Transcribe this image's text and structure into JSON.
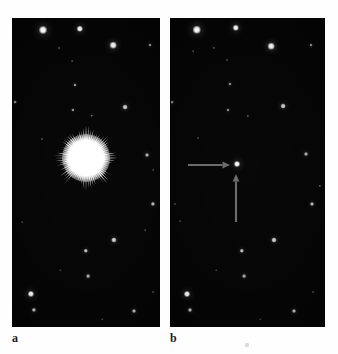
{
  "figure": {
    "kind": "astronomical-before-after-photograph",
    "background_color": "#fefefe",
    "sky_color": "#040404",
    "star_color": "#ffffff",
    "arrow_color": "#6a6a6a"
  },
  "panels": [
    {
      "id": "a",
      "caption": "a",
      "description": "Star field with bright saturated object showing radial diffraction spikes",
      "x": 12,
      "y": 18,
      "width": 148,
      "height": 309,
      "burst": {
        "cx": 74,
        "cy": 140,
        "core_radius": 17,
        "halo_radius": 24,
        "spike_max_radius": 36,
        "spike_count": 72
      },
      "stars": [
        {
          "x": 31,
          "y": 12,
          "r": 4.0,
          "b": 1.0
        },
        {
          "x": 68,
          "y": 11,
          "r": 3.2,
          "b": 0.97
        },
        {
          "x": 101,
          "y": 27,
          "r": 3.3,
          "b": 0.96
        },
        {
          "x": 138,
          "y": 27,
          "r": 1.5,
          "b": 0.55
        },
        {
          "x": 47,
          "y": 30,
          "r": 1.0,
          "b": 0.4
        },
        {
          "x": 60,
          "y": 43,
          "r": 0.9,
          "b": 0.33
        },
        {
          "x": 63,
          "y": 67,
          "r": 1.6,
          "b": 0.6
        },
        {
          "x": 3,
          "y": 84,
          "r": 1.4,
          "b": 0.52
        },
        {
          "x": 61,
          "y": 92,
          "r": 1.6,
          "b": 0.58
        },
        {
          "x": 113,
          "y": 89,
          "r": 2.4,
          "b": 0.82
        },
        {
          "x": 80,
          "y": 98,
          "r": 1.2,
          "b": 0.45
        },
        {
          "x": 30,
          "y": 121,
          "r": 1.0,
          "b": 0.38
        },
        {
          "x": 135,
          "y": 137,
          "r": 2.0,
          "b": 0.72
        },
        {
          "x": 141,
          "y": 152,
          "r": 0.9,
          "b": 0.3
        },
        {
          "x": 141,
          "y": 186,
          "r": 2.1,
          "b": 0.74
        },
        {
          "x": 133,
          "y": 212,
          "r": 0.9,
          "b": 0.3
        },
        {
          "x": 10,
          "y": 204,
          "r": 0.9,
          "b": 0.28
        },
        {
          "x": 102,
          "y": 222,
          "r": 2.6,
          "b": 0.86
        },
        {
          "x": 74,
          "y": 233,
          "r": 2.2,
          "b": 0.78
        },
        {
          "x": 76,
          "y": 258,
          "r": 1.9,
          "b": 0.68
        },
        {
          "x": 48,
          "y": 252,
          "r": 0.8,
          "b": 0.26
        },
        {
          "x": 19,
          "y": 276,
          "r": 3.1,
          "b": 0.95
        },
        {
          "x": 22,
          "y": 292,
          "r": 2.1,
          "b": 0.74
        },
        {
          "x": 122,
          "y": 293,
          "r": 2.0,
          "b": 0.7
        },
        {
          "x": 141,
          "y": 274,
          "r": 1.0,
          "b": 0.35
        },
        {
          "x": 90,
          "y": 301,
          "r": 0.8,
          "b": 0.26
        }
      ]
    },
    {
      "id": "b",
      "caption": "b",
      "description": "Same star field later; the object has faded to a faint point marked by two arrows",
      "x": 170,
      "y": 18,
      "width": 155,
      "height": 309,
      "stars": [
        {
          "x": 27,
          "y": 12,
          "r": 4.2,
          "b": 1.0
        },
        {
          "x": 66,
          "y": 10,
          "r": 3.2,
          "b": 0.97
        },
        {
          "x": 101,
          "y": 28,
          "r": 3.3,
          "b": 0.96
        },
        {
          "x": 141,
          "y": 27,
          "r": 1.5,
          "b": 0.52
        },
        {
          "x": 44,
          "y": 30,
          "r": 1.1,
          "b": 0.4
        },
        {
          "x": 57,
          "y": 42,
          "r": 1.0,
          "b": 0.35
        },
        {
          "x": 23,
          "y": 33,
          "r": 0.9,
          "b": 0.3
        },
        {
          "x": 60,
          "y": 66,
          "r": 1.6,
          "b": 0.58
        },
        {
          "x": 2,
          "y": 84,
          "r": 1.3,
          "b": 0.48
        },
        {
          "x": 58,
          "y": 92,
          "r": 1.5,
          "b": 0.55
        },
        {
          "x": 113,
          "y": 88,
          "r": 2.4,
          "b": 0.82
        },
        {
          "x": 78,
          "y": 98,
          "r": 1.1,
          "b": 0.42
        },
        {
          "x": 28,
          "y": 120,
          "r": 1.0,
          "b": 0.36
        },
        {
          "x": 67,
          "y": 146,
          "r": 3.0,
          "b": 1.0
        },
        {
          "x": 136,
          "y": 136,
          "r": 2.0,
          "b": 0.7
        },
        {
          "x": 150,
          "y": 168,
          "r": 1.1,
          "b": 0.42
        },
        {
          "x": 5,
          "y": 186,
          "r": 1.0,
          "b": 0.34
        },
        {
          "x": 142,
          "y": 186,
          "r": 2.0,
          "b": 0.72
        },
        {
          "x": 10,
          "y": 203,
          "r": 0.9,
          "b": 0.28
        },
        {
          "x": 104,
          "y": 222,
          "r": 2.5,
          "b": 0.84
        },
        {
          "x": 72,
          "y": 233,
          "r": 2.2,
          "b": 0.78
        },
        {
          "x": 74,
          "y": 258,
          "r": 1.9,
          "b": 0.66
        },
        {
          "x": 46,
          "y": 252,
          "r": 0.8,
          "b": 0.26
        },
        {
          "x": 17,
          "y": 276,
          "r": 3.0,
          "b": 0.95
        },
        {
          "x": 20,
          "y": 292,
          "r": 2.0,
          "b": 0.72
        },
        {
          "x": 124,
          "y": 293,
          "r": 2.0,
          "b": 0.7
        },
        {
          "x": 143,
          "y": 274,
          "r": 1.0,
          "b": 0.35
        },
        {
          "x": 90,
          "y": 301,
          "r": 0.8,
          "b": 0.24
        }
      ],
      "arrows": [
        {
          "name": "horizontal-pointer-arrow",
          "direction": "right",
          "tail_x": 18,
          "tail_y": 147,
          "tip_x": 60,
          "tip_y": 147,
          "color": "#6a6a6a"
        },
        {
          "name": "vertical-pointer-arrow",
          "direction": "up",
          "tail_x": 66,
          "tail_y": 204,
          "tip_x": 66,
          "tip_y": 156,
          "color": "#6a6a6a"
        }
      ]
    }
  ],
  "specks": [
    {
      "x": 247,
      "y": 345,
      "r": 1.6
    }
  ]
}
